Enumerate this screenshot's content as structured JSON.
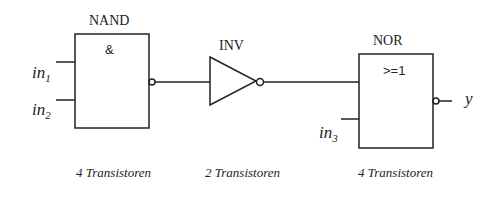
{
  "gates": {
    "nand": {
      "name": "NAND",
      "symbol": "&",
      "caption": "4 Transistoren"
    },
    "inv": {
      "name": "INV",
      "caption": "2 Transistoren"
    },
    "nor": {
      "name": "NOR",
      "symbol": ">=1",
      "caption": "4 Transistoren"
    }
  },
  "signals": {
    "in1": {
      "base": "in",
      "sub": "1"
    },
    "in2": {
      "base": "in",
      "sub": "2"
    },
    "in3": {
      "base": "in",
      "sub": "3"
    },
    "out": "y"
  },
  "colors": {
    "stroke": "#222222",
    "background": "#ffffff"
  }
}
